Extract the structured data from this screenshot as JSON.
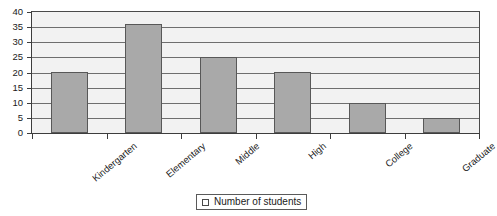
{
  "chart_data": {
    "type": "bar",
    "title": "",
    "xlabel": "",
    "ylabel": "",
    "categories": [
      "Kindergarten",
      "Elementary",
      "Middle",
      "High",
      "College",
      "Graduate"
    ],
    "values": [
      20,
      36,
      25,
      20,
      10,
      5
    ],
    "series": [
      {
        "name": "Number of students",
        "values": [
          20,
          36,
          25,
          20,
          10,
          5
        ]
      }
    ],
    "ylim": [
      0,
      40
    ],
    "y_ticks": [
      0,
      5,
      10,
      15,
      20,
      25,
      30,
      35,
      40
    ],
    "y_tick_labels": [
      "0",
      "5",
      "10",
      "15",
      "20",
      "25",
      "30",
      "35",
      "40"
    ],
    "grid": true,
    "legend": {
      "position": "bottom",
      "entries": [
        "Number of students"
      ]
    },
    "colors": {
      "bar_fill": "#a9a9a9",
      "bar_border": "#585858",
      "plot_background": "#f2f2f2",
      "gridline": "#6e6e6e",
      "axis": "#3d3d3d",
      "text": "#1a1a1a"
    }
  }
}
